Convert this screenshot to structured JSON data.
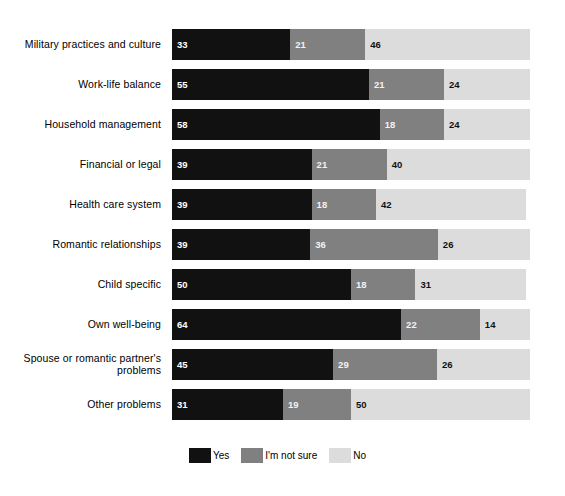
{
  "chart_data": {
    "type": "bar",
    "subtype": "stacked-horizontal-100pct",
    "title": "",
    "subtitle": "",
    "xlabel": "",
    "ylabel": "",
    "xlim": [
      0,
      100
    ],
    "grid": false,
    "legend_position": "bottom-center",
    "categories": [
      "Military practices and culture",
      "Work-life balance",
      "Household management",
      "Financial or legal",
      "Health care system",
      "Romantic relationships",
      "Child specific",
      "Own well-being",
      "Spouse or romantic partner's\nproblems",
      "Other problems"
    ],
    "series": [
      {
        "name": "Yes",
        "color": "#111111",
        "values": [
          33,
          55,
          58,
          39,
          39,
          39,
          50,
          64,
          45,
          31
        ]
      },
      {
        "name": "I'm not sure",
        "color": "#808080",
        "values": [
          21,
          21,
          18,
          21,
          18,
          36,
          18,
          22,
          29,
          19
        ]
      },
      {
        "name": "No",
        "color": "#dcdcdc",
        "values": [
          46,
          24,
          24,
          40,
          42,
          26,
          31,
          14,
          26,
          50
        ]
      }
    ],
    "legend": [
      {
        "label": "Yes",
        "color": "#111111"
      },
      {
        "label": "I'm not sure",
        "color": "#808080"
      },
      {
        "label": "No",
        "color": "#dcdcdc"
      }
    ]
  }
}
